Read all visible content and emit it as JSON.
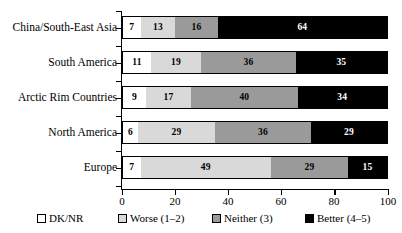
{
  "chart_data": {
    "type": "bar",
    "orientation": "horizontal",
    "stacked": true,
    "normalized_percent": true,
    "title": "",
    "subtitle": "",
    "xlabel": "",
    "ylabel": "",
    "xlim": [
      0,
      100
    ],
    "xticks": [
      0,
      20,
      40,
      60,
      80,
      100
    ],
    "xtick_labels": [
      "0",
      "20",
      "40",
      "60",
      "80",
      "100"
    ],
    "grid": false,
    "legend_position": "bottom",
    "categories": [
      "China/South-East Asia",
      "South America",
      "Arctic Rim Countries",
      "North America",
      "Europe"
    ],
    "series": [
      {
        "name": "DK/NR",
        "color": "#ffffff",
        "values": [
          7,
          11,
          9,
          6,
          7
        ]
      },
      {
        "name": "Worse (1–2)",
        "color": "#d9d9d9",
        "values": [
          13,
          19,
          17,
          29,
          49
        ]
      },
      {
        "name": "Neither (3)",
        "color": "#9a9a9a",
        "values": [
          16,
          36,
          40,
          36,
          29
        ]
      },
      {
        "name": "Better (4–5)",
        "color": "#000000",
        "values": [
          64,
          35,
          34,
          29,
          15
        ]
      }
    ],
    "legend_entries": [
      "DK/NR",
      "Worse (1–2)",
      "Neither (3)",
      "Better (4–5)"
    ]
  }
}
